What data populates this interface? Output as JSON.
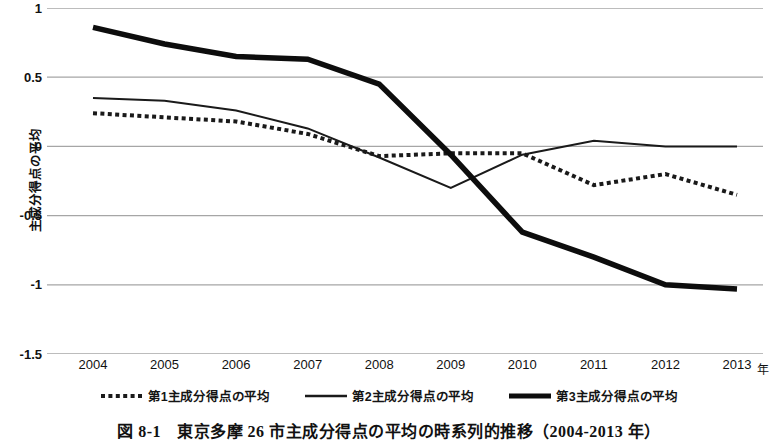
{
  "chart_data": {
    "type": "line",
    "title": "",
    "xlabel": "年",
    "ylabel": "主成分得点の平均",
    "x": [
      "2004",
      "2005",
      "2006",
      "2007",
      "2008",
      "2009",
      "2010",
      "2011",
      "2012",
      "2013"
    ],
    "xlim": [
      2004,
      2013
    ],
    "ylim": [
      -1.5,
      1
    ],
    "yticks": [
      "1",
      "0.5",
      "0",
      "-0.5",
      "-1",
      "-1.5"
    ],
    "ytick_values": [
      1,
      0.5,
      0,
      -0.5,
      -1,
      -1.5
    ],
    "grid": "horizontal",
    "legend_position": "bottom-center",
    "series": [
      {
        "name": "第1主成分得点の平均",
        "style": "dotted",
        "color": "#1a1a1a",
        "width": 4,
        "values": [
          0.24,
          0.21,
          0.18,
          0.09,
          -0.07,
          -0.05,
          -0.05,
          -0.28,
          -0.2,
          -0.35
        ]
      },
      {
        "name": "第2主成分得点の平均",
        "style": "solid",
        "color": "#1a1a1a",
        "width": 2,
        "values": [
          0.35,
          0.33,
          0.26,
          0.13,
          -0.08,
          -0.3,
          -0.06,
          0.04,
          0.0,
          0.0
        ]
      },
      {
        "name": "第3主成分得点の平均",
        "style": "solid",
        "color": "#0d0d0d",
        "width": 5.5,
        "values": [
          0.86,
          0.74,
          0.65,
          0.63,
          0.45,
          -0.06,
          -0.62,
          -0.8,
          -1.0,
          -1.03
        ]
      }
    ]
  },
  "axis": {
    "y_title": "主成分得点の平均",
    "x_unit": "年"
  },
  "caption": {
    "number": "図 8-1",
    "text": "東京多摩 26 市主成分得点の平均の時系列的推移（2004-2013 年）"
  },
  "colors": {
    "gridline": "#a6a6a6",
    "text": "#111111",
    "line": "#111111",
    "background": "#ffffff"
  }
}
